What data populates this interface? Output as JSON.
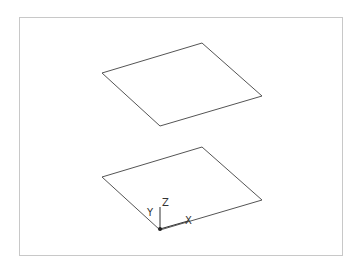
{
  "frame": {
    "x": 19,
    "y": 17,
    "width": 323,
    "height": 238,
    "stroke": "#c8c8c8"
  },
  "planes": [
    {
      "name": "upper-plane",
      "points": [
        [
          102,
          73
        ],
        [
          202,
          43
        ],
        [
          262,
          96
        ],
        [
          160,
          126
        ]
      ],
      "stroke": "#555555"
    },
    {
      "name": "lower-plane",
      "points": [
        [
          102,
          177
        ],
        [
          202,
          147
        ],
        [
          262,
          200
        ],
        [
          160,
          230
        ]
      ],
      "stroke": "#555555"
    }
  ],
  "ucs_icon": {
    "origin": [
      160,
      229
    ],
    "labels": {
      "x": "X",
      "y": "Y",
      "z": "Z"
    }
  }
}
